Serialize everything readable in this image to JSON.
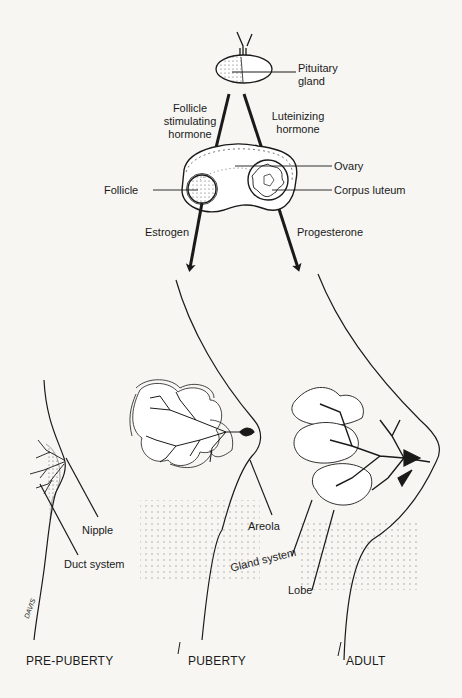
{
  "diagram": {
    "type": "anatomical-illustration",
    "labels": {
      "pituitary": "Pituitary gland",
      "pituitary_l1": "Pituitary",
      "pituitary_l2": "gland",
      "fsh_l1": "Follicle",
      "fsh_l2": "stimulating",
      "fsh_l3": "hormone",
      "lh_l1": "Luteinizing",
      "lh_l2": "hormone",
      "ovary": "Ovary",
      "follicle": "Follicle",
      "corpus_luteum": "Corpus luteum",
      "estrogen": "Estrogen",
      "progesterone": "Progesterone",
      "nipple": "Nipple",
      "duct_system": "Duct system",
      "areola": "Areola",
      "gland_system": "Gland system",
      "lobe": "Lobe"
    },
    "stages": [
      "PRE-PUBERTY",
      "PUBERTY",
      "ADULT"
    ],
    "signature": "DAVIS",
    "colors": {
      "ink": "#1a1a1a",
      "paper": "#f7f6f3",
      "stipple": "#555555"
    }
  }
}
